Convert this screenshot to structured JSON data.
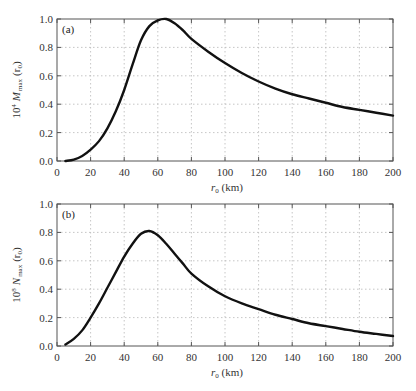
{
  "chart_data": [
    {
      "type": "line",
      "panel_label": "(a)",
      "title": "",
      "xlabel": "r0 (km)",
      "xlabel_main": "r",
      "xlabel_sub": "0",
      "xlabel_unit": " (km)",
      "ylabel": "10^4 M_max (r0)",
      "ylabel_prefix": "10",
      "ylabel_exp": "4",
      "ylabel_var": "M",
      "ylabel_sub": "max",
      "ylabel_arg": "(r",
      "ylabel_arg_sub": "0",
      "ylabel_close": ")",
      "xlim": [
        0,
        200
      ],
      "ylim": [
        0.0,
        1.0
      ],
      "xticks": [
        0,
        20,
        40,
        60,
        80,
        100,
        120,
        140,
        160,
        180,
        200
      ],
      "yticks": [
        "0.0",
        "0.2",
        "0.4",
        "0.6",
        "0.8",
        "1.0"
      ],
      "grid": true,
      "series": [
        {
          "name": "M_max",
          "x": [
            5,
            10,
            15,
            20,
            25,
            30,
            35,
            40,
            45,
            50,
            55,
            60,
            65,
            70,
            75,
            80,
            90,
            100,
            110,
            120,
            130,
            140,
            150,
            160,
            170,
            180,
            190,
            200
          ],
          "y": [
            0.0,
            0.01,
            0.035,
            0.08,
            0.14,
            0.23,
            0.35,
            0.5,
            0.68,
            0.85,
            0.95,
            0.99,
            1.0,
            0.97,
            0.92,
            0.86,
            0.77,
            0.69,
            0.62,
            0.56,
            0.51,
            0.47,
            0.44,
            0.41,
            0.38,
            0.36,
            0.34,
            0.32
          ]
        }
      ]
    },
    {
      "type": "line",
      "panel_label": "(b)",
      "title": "",
      "xlabel": "r0 (km)",
      "xlabel_main": "r",
      "xlabel_sub": "0",
      "xlabel_unit": " (km)",
      "ylabel": "10^8 N_max (r0)",
      "ylabel_prefix": "10",
      "ylabel_exp": "8",
      "ylabel_var": "N",
      "ylabel_sub": "max",
      "ylabel_arg": "(r",
      "ylabel_arg_sub": "0",
      "ylabel_close": ")",
      "xlim": [
        0,
        200
      ],
      "ylim": [
        0.0,
        1.0
      ],
      "xticks": [
        0,
        20,
        40,
        60,
        80,
        100,
        120,
        140,
        160,
        180,
        200
      ],
      "yticks": [
        "0.0",
        "0.2",
        "0.4",
        "0.6",
        "0.8",
        "1.0"
      ],
      "grid": true,
      "series": [
        {
          "name": "N_max",
          "x": [
            5,
            10,
            15,
            20,
            25,
            30,
            35,
            40,
            45,
            50,
            55,
            60,
            65,
            70,
            75,
            80,
            90,
            100,
            110,
            120,
            130,
            140,
            150,
            160,
            170,
            180,
            190,
            200
          ],
          "y": [
            0.01,
            0.05,
            0.11,
            0.2,
            0.3,
            0.41,
            0.52,
            0.63,
            0.72,
            0.79,
            0.81,
            0.78,
            0.72,
            0.65,
            0.58,
            0.51,
            0.42,
            0.35,
            0.3,
            0.26,
            0.22,
            0.19,
            0.16,
            0.14,
            0.12,
            0.1,
            0.085,
            0.07
          ]
        }
      ]
    }
  ]
}
